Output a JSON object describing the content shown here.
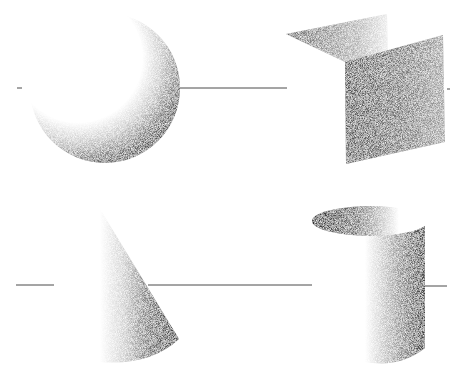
{
  "background": "#ffffff",
  "ink": "#2a2a2a",
  "shapes": [
    {
      "name": "sphere",
      "description": "Shaded sphere, light from upper-left, crescent shadow on lower-right"
    },
    {
      "name": "folded-plane",
      "description": "Two-panel folded card, dark vertical front face"
    },
    {
      "name": "cone",
      "description": "Shaded cone, dark on right side"
    },
    {
      "name": "cylinder",
      "description": "Open cylinder, dark interior rim on left and dark right side"
    }
  ],
  "horizon_lines": [
    {
      "row": "top",
      "y": 88
    },
    {
      "row": "bottom",
      "y": 285
    }
  ]
}
